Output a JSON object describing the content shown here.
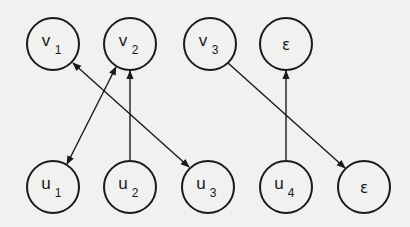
{
  "diagram": {
    "type": "bipartite-matching-graph",
    "top_row": [
      {
        "id": "v1",
        "base": "v",
        "sub": "1",
        "x": 53,
        "y": 44
      },
      {
        "id": "v2",
        "base": "v",
        "sub": "2",
        "x": 130,
        "y": 44
      },
      {
        "id": "v3",
        "base": "v",
        "sub": "3",
        "x": 210,
        "y": 44
      },
      {
        "id": "eps_top",
        "base": "ε",
        "sub": "",
        "x": 286,
        "y": 44
      }
    ],
    "bottom_row": [
      {
        "id": "u1",
        "base": "u",
        "sub": "1",
        "x": 53,
        "y": 187
      },
      {
        "id": "u2",
        "base": "u",
        "sub": "2",
        "x": 130,
        "y": 187
      },
      {
        "id": "u3",
        "base": "u",
        "sub": "3",
        "x": 208,
        "y": 187
      },
      {
        "id": "u4",
        "base": "u",
        "sub": "4",
        "x": 286,
        "y": 187
      },
      {
        "id": "eps_bottom",
        "base": "ε",
        "sub": "",
        "x": 364,
        "y": 187
      }
    ],
    "edges": [
      {
        "from": "u1",
        "to": "v2",
        "arrows": "both"
      },
      {
        "from": "v1",
        "to": "u3",
        "arrows": "both"
      },
      {
        "from": "u2",
        "to": "v2",
        "arrows": "end"
      },
      {
        "from": "u4",
        "to": "eps_top",
        "arrows": "end"
      },
      {
        "from": "v3",
        "to": "eps_bottom",
        "arrows": "end"
      }
    ],
    "node_radius": 26,
    "colors": {
      "stroke": "#1a1a1a",
      "background": "#f1f1ef"
    }
  }
}
